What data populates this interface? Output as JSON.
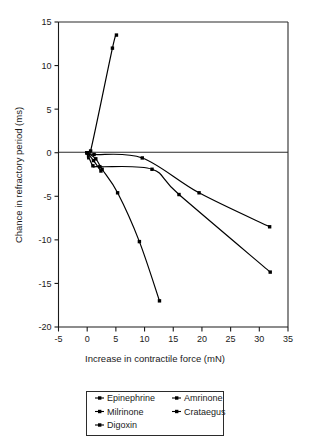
{
  "chart_data": {
    "type": "line",
    "title": "",
    "xlabel": "Increase in contractile force (mN)",
    "ylabel": "Chance in refractory period (ms)",
    "xlim": [
      -5,
      35
    ],
    "ylim": [
      -20,
      15
    ],
    "xticks": [
      "-5",
      "0",
      "5",
      "10",
      "15",
      "20",
      "25",
      "30",
      "35"
    ],
    "xtick_values": [
      -5,
      0,
      5,
      10,
      15,
      20,
      25,
      30,
      35
    ],
    "yticks": [
      "15",
      "10",
      "5",
      "0",
      "-5",
      "-10",
      "-15",
      "-20"
    ],
    "ytick_values": [
      15,
      10,
      5,
      0,
      -5,
      -10,
      -15,
      -20
    ],
    "grid": false,
    "legend_position": "below",
    "zero_line": true,
    "series": [
      {
        "name": "Epinephrine",
        "marker": "square",
        "points": [
          [
            0,
            0
          ],
          [
            0.6,
            0.2
          ],
          [
            4.4,
            12.0
          ],
          [
            5.1,
            13.5
          ]
        ]
      },
      {
        "name": "Amrinone",
        "marker": "square",
        "points": [
          [
            0,
            0
          ],
          [
            1.2,
            -0.2
          ],
          [
            9.6,
            -0.6
          ],
          [
            19.5,
            -4.6
          ],
          [
            31.8,
            -8.5
          ]
        ]
      },
      {
        "name": "Milrinone",
        "marker": "square",
        "points": [
          [
            0,
            0
          ],
          [
            1.0,
            -1.5
          ],
          [
            2.2,
            -1.6
          ],
          [
            11.3,
            -1.9
          ],
          [
            16.0,
            -4.8
          ],
          [
            31.9,
            -13.7
          ]
        ]
      },
      {
        "name": "Crataegus",
        "marker": "square",
        "points": [
          [
            0,
            0
          ],
          [
            1.5,
            -0.7
          ],
          [
            2.6,
            -1.9
          ],
          [
            5.3,
            -4.6
          ],
          [
            9.1,
            -10.2
          ],
          [
            12.6,
            -17.0
          ]
        ]
      },
      {
        "name": "Digoxin",
        "marker": "square",
        "points": [
          [
            0,
            0
          ],
          [
            1.1,
            -0.9
          ],
          [
            2.4,
            -2.1
          ]
        ]
      }
    ]
  },
  "legend": {
    "entries": [
      {
        "label": "Epinephrine"
      },
      {
        "label": "Amrinone"
      },
      {
        "label": "Milrinone"
      },
      {
        "label": "Crataegus"
      },
      {
        "label": "Digoxin"
      }
    ]
  },
  "colors": {
    "line": "#000000",
    "axis": "#1a1a1a",
    "background": "#ffffff"
  }
}
